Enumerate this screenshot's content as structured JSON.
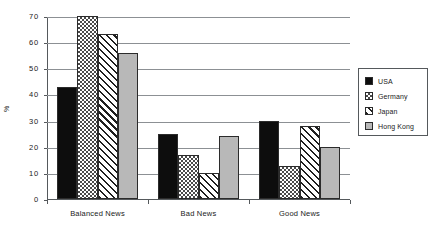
{
  "chart_data": {
    "type": "bar",
    "title": "",
    "subtitle": "",
    "xlabel": "",
    "ylabel": "%",
    "ylim": [
      0,
      70
    ],
    "yticks": [
      0,
      10,
      20,
      30,
      40,
      50,
      60,
      70
    ],
    "ytick_labels": [
      "0",
      "10",
      "20",
      "30",
      "40",
      "50",
      "60",
      "70"
    ],
    "grid": true,
    "grid_axis": "y",
    "legend_position": "right",
    "categories": [
      "Balanced News",
      "Bad News",
      "Good News"
    ],
    "series": [
      {
        "name": "USA",
        "pattern": "solid-black",
        "color": "#0d0d0d",
        "values": [
          43,
          25,
          30
        ]
      },
      {
        "name": "Germany",
        "pattern": "checker",
        "color": "#4a4a4a",
        "values": [
          70,
          17,
          12.5
        ]
      },
      {
        "name": "Japan",
        "pattern": "diagonal",
        "color": "#1f1f1f",
        "values": [
          63,
          10,
          28
        ]
      },
      {
        "name": "Hong Kong",
        "pattern": "solid-gray",
        "color": "#b8b8b8",
        "values": [
          56,
          24,
          20
        ]
      }
    ]
  },
  "legend": {
    "items": [
      {
        "label": "USA"
      },
      {
        "label": "Germany"
      },
      {
        "label": "Japan"
      },
      {
        "label": "Hong Kong"
      }
    ]
  }
}
